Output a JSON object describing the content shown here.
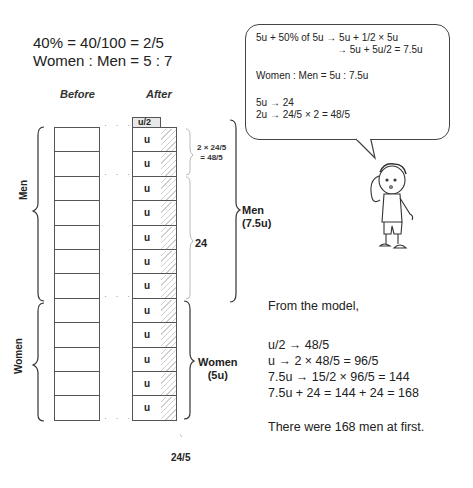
{
  "top_equations": {
    "line1": "40% = 40/100 = 2/5",
    "line2": "Women : Men = 5 : 7"
  },
  "model": {
    "before_title": "Before",
    "after_title": "After",
    "half_unit_label": "u/2",
    "unit_label": "u",
    "rows": 12,
    "men_rows": 7,
    "women_rows": 5,
    "left_labels": {
      "men": "Men",
      "women": "Women"
    },
    "annotations": {
      "top_two": "2 × 24/5\n= 48/5",
      "top_two_line1": "2 × 24/5",
      "top_two_line2": "= 48/5",
      "remaining_men": "24",
      "men_total_line1": "Men",
      "men_total_line2": "(7.5u)",
      "women_total_line1": "Women",
      "women_total_line2": "(5u)",
      "bottom_part": "24/5"
    }
  },
  "speech_bubble": {
    "line1": "5u + 50% of 5u → 5u + 1/2 × 5u",
    "line2": "→ 5u + 5u/2 = 7.5u",
    "line3": "Women : Men = 5u : 7.5u",
    "line4": "5u → 24",
    "line5": "2u → 24/5 × 2 = 48/5"
  },
  "solution": {
    "intro": "From the model,",
    "steps": [
      "u/2 → 48/5",
      "u → 2 × 48/5 = 96/5",
      "7.5u → 15/2 × 96/5 = 144",
      "7.5u + 24 = 144 + 24 = 168"
    ],
    "answer": "There were 168 men at first."
  },
  "colors": {
    "line": "#555555",
    "hatch": "#cfcfcf",
    "text": "#222222"
  }
}
